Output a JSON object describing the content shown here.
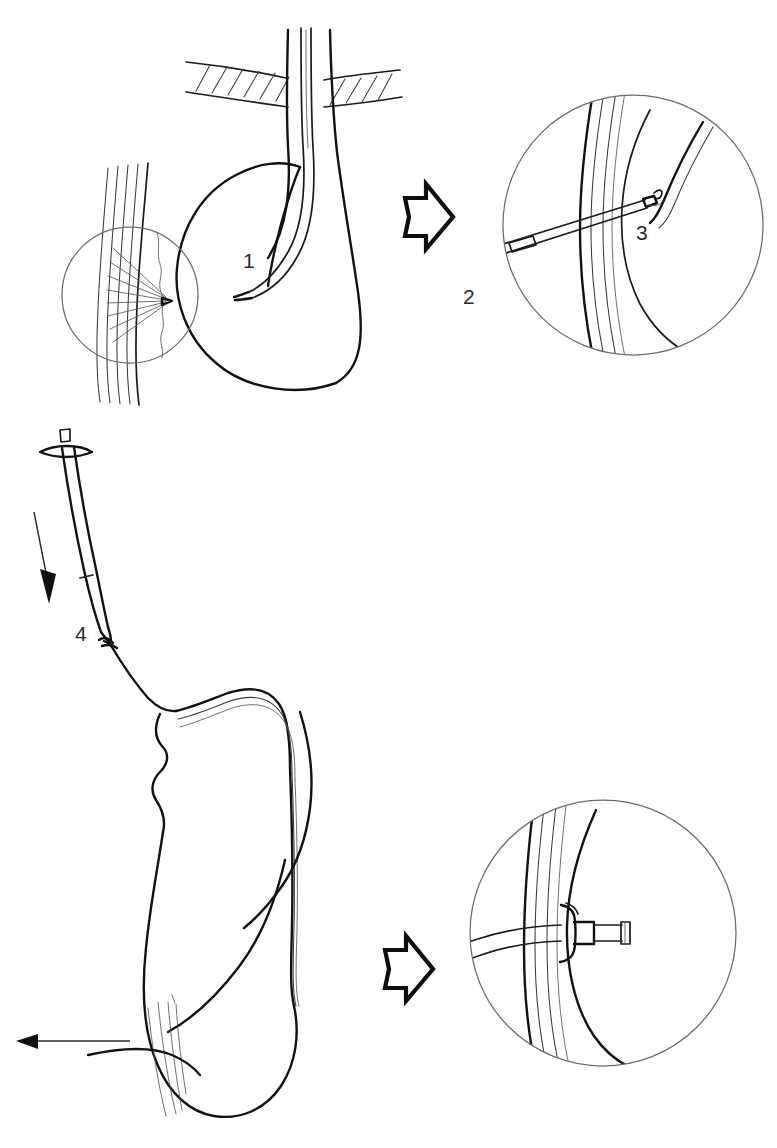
{
  "figure": {
    "background_color": "#ffffff",
    "ink_color": "#1b1b1b",
    "label_color": "#2b2b2b",
    "width": 777,
    "height": 1148
  },
  "labels": [
    {
      "id": "label-1",
      "text": "1",
      "x": 243,
      "y": 268,
      "meaning": "endoscope-indenting-gastric-wall"
    },
    {
      "id": "label-2",
      "text": "2",
      "x": 463,
      "y": 304,
      "meaning": "guidewire-snare-loop"
    },
    {
      "id": "label-3",
      "text": "3",
      "x": 636,
      "y": 240,
      "meaning": "needle-cannula-puncture"
    },
    {
      "id": "label-4",
      "text": "4",
      "x": 75,
      "y": 641,
      "meaning": "suture-knot-on-dilator"
    }
  ],
  "panels": [
    {
      "id": "panel-upper-overview",
      "name": "Step 1 overview — transillumination and finger indentation",
      "detail_circle": {
        "cx": 130,
        "cy": 295,
        "r": 68
      },
      "contains": [
        "abdominal-wall-hatched-band",
        "esophagus-stomach-outline",
        "endoscope-shaft",
        "transillumination-rays",
        "puncture-point"
      ]
    },
    {
      "id": "panel-upper-detail",
      "name": "Step 2/3 detail — needle puncture with snare capture",
      "detail_circle": {
        "cx": 633,
        "cy": 225,
        "r": 130
      },
      "contains": [
        "gastric-wall-layers",
        "cannula-needle",
        "snare-wire",
        "guidewire-thread"
      ]
    },
    {
      "id": "panel-lower-overview",
      "name": "Step 4 overview — dilator with gastrostomy tube pulled retrograde",
      "contains": [
        "dilator-t-handle",
        "dilator-shaft",
        "suture-knot",
        "esophagus-stomach-outline",
        "traction-arrow",
        "push-arrow"
      ]
    },
    {
      "id": "panel-lower-detail",
      "name": "Final detail — internal bumper seated against gastric wall",
      "detail_circle": {
        "cx": 603,
        "cy": 933,
        "r": 133
      },
      "contains": [
        "gastric-wall-layers",
        "internal-bumper-flange",
        "feeding-tube-port"
      ]
    }
  ],
  "arrows": [
    {
      "id": "arrow-step-upper",
      "style": "hollow-block",
      "direction": "right",
      "x": 400,
      "y": 180,
      "width": 56,
      "height": 72
    },
    {
      "id": "arrow-step-lower",
      "style": "hollow-block",
      "direction": "right",
      "x": 380,
      "y": 935,
      "width": 56,
      "height": 72
    },
    {
      "id": "arrow-push-down",
      "style": "thin-solid",
      "direction": "down",
      "x": 42,
      "y": 510,
      "length": 88
    },
    {
      "id": "arrow-traction-left",
      "style": "thin-solid",
      "direction": "left",
      "x": 20,
      "y": 1040,
      "length": 130
    }
  ],
  "legend_note": "Line drawing, monochrome ink on white; no axes, no text other than step numerals."
}
